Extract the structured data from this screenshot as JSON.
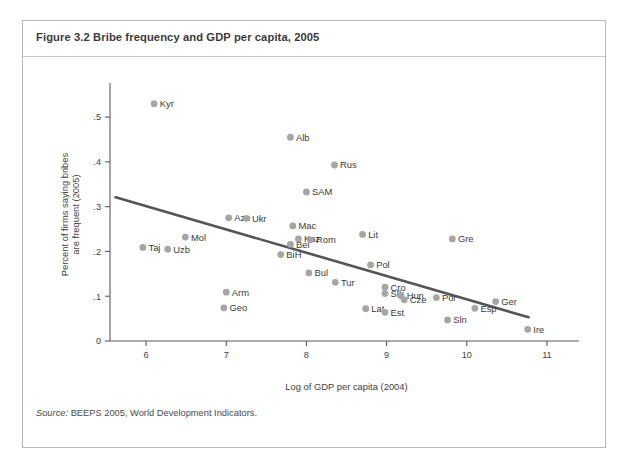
{
  "figure": {
    "number": "Figure 3.2",
    "title": "Figure 3.2  Bribe frequency and GDP per capita, 2005",
    "source_label": "Source:",
    "source_text": " BEEPS 2005, World Development Indicators."
  },
  "colors": {
    "frame_border": "#b9b9b9",
    "title_text": "#3b3b3b",
    "axis": "#5a5a5a",
    "marker": "#a5a5a5",
    "trend_line": "#555555",
    "label_text": "#3a3a3a",
    "background": "#ffffff"
  },
  "chart_data": {
    "type": "scatter",
    "title": "Bribe frequency and GDP per capita, 2005",
    "subtitle": "",
    "xlabel": "Log of GDP per capita (2004)",
    "ylabel": "Percent of firms saying bribes are frequent (2005)",
    "ylabel_line1": "Percent of firms saying bribes",
    "ylabel_line2": "are frequent (2005)",
    "xlim": [
      5.55,
      11.25
    ],
    "ylim": [
      0,
      0.565
    ],
    "xticks": [
      6,
      7,
      8,
      9,
      10,
      11
    ],
    "xticklabels": [
      "6",
      "7",
      "8",
      "9",
      "10",
      "11"
    ],
    "yticks": [
      0,
      0.1,
      0.2,
      0.3,
      0.4,
      0.5
    ],
    "yticklabels": [
      "0",
      ".1",
      ".2",
      ".3",
      ".4",
      ".5"
    ],
    "grid": false,
    "legend": "none",
    "points": [
      {
        "label": "Kyr",
        "x": 6.1,
        "y": 0.53,
        "label_pos": "right"
      },
      {
        "label": "Taj",
        "x": 5.96,
        "y": 0.209,
        "label_pos": "right"
      },
      {
        "label": "Uzb",
        "x": 6.27,
        "y": 0.205,
        "label_pos": "right"
      },
      {
        "label": "Mol",
        "x": 6.49,
        "y": 0.232,
        "label_pos": "right"
      },
      {
        "label": "Arm",
        "x": 7.0,
        "y": 0.109,
        "label_pos": "right"
      },
      {
        "label": "Geo",
        "x": 6.97,
        "y": 0.074,
        "label_pos": "right"
      },
      {
        "label": "Aze",
        "x": 7.03,
        "y": 0.275,
        "label_pos": "right"
      },
      {
        "label": "Ukr",
        "x": 7.25,
        "y": 0.274,
        "label_pos": "right"
      },
      {
        "label": "Alb",
        "x": 7.8,
        "y": 0.455,
        "label_pos": "right"
      },
      {
        "label": "BiH",
        "x": 7.68,
        "y": 0.193,
        "label_pos": "right"
      },
      {
        "label": "Bel",
        "x": 7.8,
        "y": 0.216,
        "label_pos": "right"
      },
      {
        "label": "Mac",
        "x": 7.83,
        "y": 0.257,
        "label_pos": "right"
      },
      {
        "label": "SAM",
        "x": 8.0,
        "y": 0.333,
        "label_pos": "right"
      },
      {
        "label": "Kaz",
        "x": 7.9,
        "y": 0.228,
        "label_pos": "right"
      },
      {
        "label": "Rom",
        "x": 8.05,
        "y": 0.226,
        "label_pos": "right"
      },
      {
        "label": "Bul",
        "x": 8.03,
        "y": 0.152,
        "label_pos": "right"
      },
      {
        "label": "Rus",
        "x": 8.35,
        "y": 0.393,
        "label_pos": "right"
      },
      {
        "label": "Tur",
        "x": 8.36,
        "y": 0.131,
        "label_pos": "right"
      },
      {
        "label": "Lit",
        "x": 8.7,
        "y": 0.238,
        "label_pos": "right"
      },
      {
        "label": "Lat",
        "x": 8.74,
        "y": 0.072,
        "label_pos": "right"
      },
      {
        "label": "Pol",
        "x": 8.8,
        "y": 0.17,
        "label_pos": "right"
      },
      {
        "label": "Cro",
        "x": 8.98,
        "y": 0.12,
        "label_pos": "right"
      },
      {
        "label": "Slk",
        "x": 8.98,
        "y": 0.106,
        "label_pos": "right"
      },
      {
        "label": "Est",
        "x": 8.98,
        "y": 0.064,
        "label_pos": "right"
      },
      {
        "label": "Hun",
        "x": 9.18,
        "y": 0.101,
        "label_pos": "right"
      },
      {
        "label": "Cze",
        "x": 9.22,
        "y": 0.092,
        "label_pos": "right"
      },
      {
        "label": "Sln",
        "x": 9.76,
        "y": 0.047,
        "label_pos": "right"
      },
      {
        "label": "Gre",
        "x": 9.82,
        "y": 0.228,
        "label_pos": "right"
      },
      {
        "label": "Por",
        "x": 9.62,
        "y": 0.097,
        "label_pos": "right"
      },
      {
        "label": "Esp",
        "x": 10.1,
        "y": 0.073,
        "label_pos": "right"
      },
      {
        "label": "Ger",
        "x": 10.36,
        "y": 0.088,
        "label_pos": "right"
      },
      {
        "label": "Ire",
        "x": 10.76,
        "y": 0.026,
        "label_pos": "right"
      }
    ],
    "trend_line": {
      "name": "fitted regression line",
      "x0": 5.62,
      "y0": 0.321,
      "x1": 10.77,
      "y1": 0.053
    }
  }
}
